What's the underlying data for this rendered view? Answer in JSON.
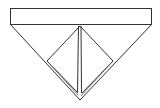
{
  "diagram": {
    "kind": "fold-diagram",
    "parts": [
      {
        "name": "top-band"
      },
      {
        "name": "inverted-triangle"
      },
      {
        "name": "inner-diamond-flap-left"
      },
      {
        "name": "inner-diamond-flap-right"
      },
      {
        "name": "center-crease"
      }
    ],
    "line_color": "#333333",
    "background_color": "#ffffff"
  }
}
